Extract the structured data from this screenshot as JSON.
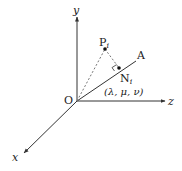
{
  "diagram": {
    "type": "3d-coordinate-projection",
    "colors": {
      "line": "#333333",
      "dashed": "#777777",
      "background": "#ffffff"
    },
    "axes": [
      {
        "name": "y",
        "label": "y"
      },
      {
        "name": "z",
        "label": "z"
      },
      {
        "name": "x",
        "label": "x"
      }
    ],
    "origin": {
      "label": "O"
    },
    "line": {
      "label": "A"
    },
    "points": [
      {
        "name": "P",
        "label": "P",
        "subscript": "i"
      },
      {
        "name": "N",
        "label": "N",
        "subscript": "i",
        "coords": "(λ, μ, ν)"
      }
    ]
  }
}
